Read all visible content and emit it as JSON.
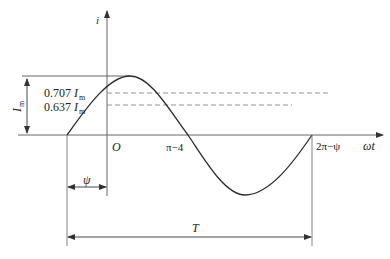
{
  "diagram": {
    "axes": {
      "y_label": "i",
      "x_label": "ωt",
      "origin_label": "O"
    },
    "labels": {
      "amplitude": "I",
      "amplitude_sub": "m",
      "rms_coef": "0.707",
      "rms_sym": "I",
      "rms_sub": "m",
      "avg_coef": "0.637",
      "avg_sym": "I",
      "avg_sub": "m",
      "zero_cross_mid": "π−4",
      "zero_cross_end": "2π−ψ",
      "phase": "ψ",
      "period": "T"
    },
    "colors": {
      "line": "#2a2a2a",
      "axis": "#555555",
      "dashed": "#888888"
    }
  }
}
